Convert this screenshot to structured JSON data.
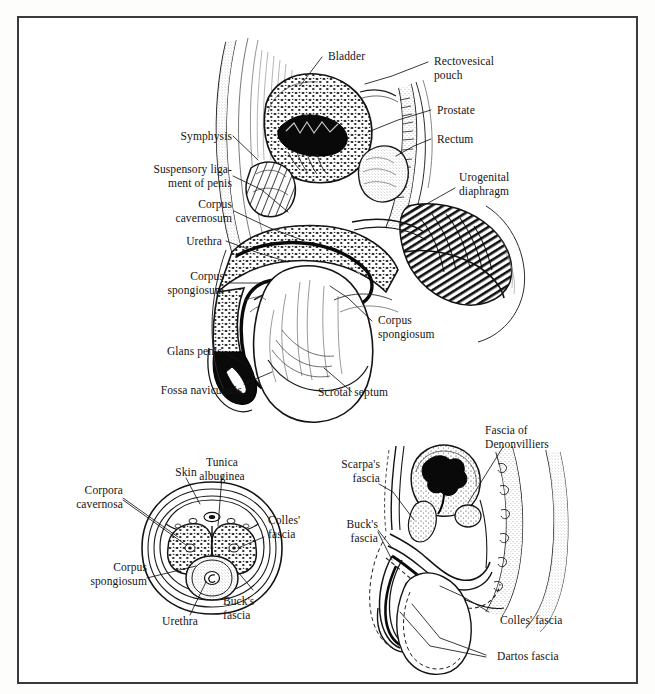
{
  "plate": {
    "title": "Male pelvic and penile anatomy plate",
    "border_color": "#3a3a3a",
    "ink_color": "#141414",
    "paper_color": "#ffffff"
  },
  "figures": [
    {
      "id": "sagittal-pelvis",
      "name": "Midsagittal section of male pelvis",
      "labels": [
        {
          "key": "bladder",
          "text": "Bladder"
        },
        {
          "key": "rectovesical_pouch",
          "text": "Rectovesical\npouch"
        },
        {
          "key": "prostate",
          "text": "Prostate"
        },
        {
          "key": "rectum",
          "text": "Rectum"
        },
        {
          "key": "urogenital_diaphragm",
          "text": "Urogenital\ndiaphragm"
        },
        {
          "key": "symphysis",
          "text": "Symphysis"
        },
        {
          "key": "suspensory_ligament",
          "text": "Suspensory liga-\nment of penis"
        },
        {
          "key": "corpus_cavernosum",
          "text": "Corpus\ncavernosum"
        },
        {
          "key": "urethra",
          "text": "Urethra"
        },
        {
          "key": "corpus_spongiosum_left",
          "text": "Corpus\nspongiosum"
        },
        {
          "key": "glans_penis",
          "text": "Glans penis"
        },
        {
          "key": "fossa_navicularis",
          "text": "Fossa navicularis"
        },
        {
          "key": "corpus_spongiosum_right",
          "text": "Corpus\nspongiosum"
        },
        {
          "key": "scrotal_septum",
          "text": "Scrotal septum"
        }
      ]
    },
    {
      "id": "penile-cross-section",
      "name": "Transverse cross-section of penis",
      "labels": [
        {
          "key": "corpora_cavernosa",
          "text": "Corpora\ncavernosa"
        },
        {
          "key": "skin",
          "text": "Skin"
        },
        {
          "key": "tunica_albuginea",
          "text": "Tunica\nalbuginea"
        },
        {
          "key": "colles_fascia",
          "text": "Colles'\nfascia"
        },
        {
          "key": "bucks_fascia",
          "text": "Buck's\nfascia"
        },
        {
          "key": "corpus_spongiosum",
          "text": "Corpus\nspongiosum"
        },
        {
          "key": "urethra",
          "text": "Urethra"
        }
      ]
    },
    {
      "id": "fascial-planes",
      "name": "Sagittal diagram of fascial planes",
      "labels": [
        {
          "key": "fascia_of_denonvilliers",
          "text": "Fascia of\nDenonvilliers"
        },
        {
          "key": "scarpas_fascia",
          "text": "Scarpa's\nfascia"
        },
        {
          "key": "bucks_fascia",
          "text": "Buck's\nfascia"
        },
        {
          "key": "colles_fascia",
          "text": "Colles' fascia"
        },
        {
          "key": "dartos_fascia",
          "text": "Dartos fascia"
        }
      ]
    }
  ]
}
